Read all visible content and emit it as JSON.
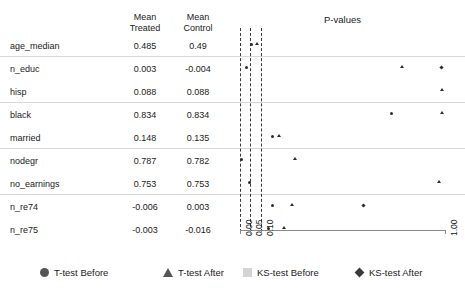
{
  "table": {
    "headers": {
      "variable": "",
      "mean_treated": "Mean\nTreated",
      "mean_control": "Mean\nControl"
    },
    "rows": [
      {
        "variable": "age_median",
        "mean_treated": "0.485",
        "mean_control": "0.49"
      },
      {
        "variable": "n_educ",
        "mean_treated": "0.003",
        "mean_control": "-0.004"
      },
      {
        "variable": "hisp",
        "mean_treated": "0.088",
        "mean_control": "0.088"
      },
      {
        "variable": "black",
        "mean_treated": "0.834",
        "mean_control": "0.834"
      },
      {
        "variable": "married",
        "mean_treated": "0.148",
        "mean_control": "0.135"
      },
      {
        "variable": "nodegr",
        "mean_treated": "0.787",
        "mean_control": "0.782"
      },
      {
        "variable": "no_earnings",
        "mean_treated": "0.753",
        "mean_control": "0.753"
      },
      {
        "variable": "n_re74",
        "mean_treated": "-0.006",
        "mean_control": "0.003"
      },
      {
        "variable": "n_re75",
        "mean_treated": "-0.003",
        "mean_control": "-0.016"
      }
    ]
  },
  "chart_data": {
    "type": "scatter",
    "title": "P-values",
    "xlabel": "",
    "ylabel": "",
    "xlim": [
      0,
      1
    ],
    "xticks": [
      0.0,
      0.05,
      0.1,
      1.0
    ],
    "xticklabels": [
      "0.00",
      "0.05",
      "0.10",
      "1.00"
    ],
    "grid": false,
    "reference_lines": [
      {
        "value": 0.05,
        "style": "dashed"
      },
      {
        "value": 0.1,
        "style": "dashed"
      }
    ],
    "legend_position": "bottom",
    "categories": [
      "age_median",
      "n_educ",
      "hisp",
      "black",
      "married",
      "nodegr",
      "no_earnings",
      "n_re74",
      "n_re75"
    ],
    "series": [
      {
        "name": "T-test Before",
        "marker": "circle",
        "color": "#2b2b2b",
        "values": [
          0.055,
          0.79,
          0.96,
          0.99,
          0.67,
          0.005,
          0.99,
          0.42,
          0.29
        ]
      },
      {
        "name": "T-test After",
        "marker": "triangle",
        "color": "#2b2b2b",
        "values": [
          0.08,
          0.99,
          0.99,
          0.99,
          0.7,
          0.22,
          0.99,
          0.21,
          0.195
        ]
      },
      {
        "name": "KS-test Before",
        "marker": "square",
        "color": "#c9c9c9",
        "values": [
          0.0,
          0.0,
          0.0,
          0.0,
          0.0,
          0.0,
          0.0,
          0.0,
          0.0
        ]
      },
      {
        "name": "KS-test After",
        "marker": "diamond",
        "color": "#2b2b2b",
        "values": [
          0.0,
          0.0,
          0.0,
          0.0,
          0.0,
          0.0,
          0.0,
          0.6,
          0.0
        ]
      }
    ],
    "points": [
      {
        "row": 0,
        "x": 0.055,
        "marker": "circle"
      },
      {
        "row": 0,
        "x": 0.085,
        "marker": "triangle"
      },
      {
        "row": 1,
        "x": 0.03,
        "marker": "circle"
      },
      {
        "row": 1,
        "x": 0.79,
        "marker": "triangle"
      },
      {
        "row": 1,
        "x": 0.985,
        "marker": "diamond"
      },
      {
        "row": 2,
        "x": 0.985,
        "marker": "triangle"
      },
      {
        "row": 3,
        "x": 0.74,
        "marker": "circle"
      },
      {
        "row": 3,
        "x": 0.985,
        "marker": "triangle"
      },
      {
        "row": 4,
        "x": 0.16,
        "marker": "circle"
      },
      {
        "row": 4,
        "x": 0.19,
        "marker": "triangle"
      },
      {
        "row": 5,
        "x": 0.005,
        "marker": "circle"
      },
      {
        "row": 5,
        "x": 0.27,
        "marker": "triangle"
      },
      {
        "row": 6,
        "x": 0.045,
        "marker": "circle"
      },
      {
        "row": 6,
        "x": 0.97,
        "marker": "triangle"
      },
      {
        "row": 7,
        "x": 0.16,
        "marker": "circle"
      },
      {
        "row": 7,
        "x": 0.255,
        "marker": "triangle"
      },
      {
        "row": 7,
        "x": 0.6,
        "marker": "diamond"
      },
      {
        "row": 8,
        "x": 0.14,
        "marker": "circle"
      },
      {
        "row": 8,
        "x": 0.215,
        "marker": "triangle"
      }
    ]
  },
  "legend": {
    "items": [
      {
        "label": "T-test Before",
        "marker": "circle"
      },
      {
        "label": "T-test After",
        "marker": "triangle"
      },
      {
        "label": "KS-test Before",
        "marker": "square"
      },
      {
        "label": "KS-test After",
        "marker": "diamond"
      }
    ]
  }
}
